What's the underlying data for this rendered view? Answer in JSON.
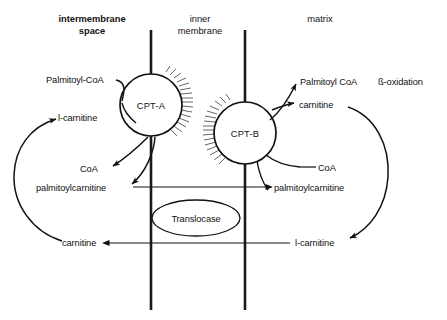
{
  "figure": {
    "background_color": "#ffffff",
    "ink_color": "#121212"
  },
  "headers": {
    "left": "intermembrane\nspace",
    "left_line1": "intermembrane",
    "left_line2": "space",
    "middle_line1": "inner",
    "middle_line2": "membrane",
    "right": "matrix"
  },
  "enzymes": {
    "cpt_a": "CPT-A",
    "cpt_b": "CPT-B",
    "translocase": "Translocase"
  },
  "labels": {
    "palmitoyl_coa_left": "Palmitoyl-CoA",
    "l_carnitine_left": "l-carnitine",
    "coa_left": "CoA",
    "palmitoylcarnitine_left": "palmitoylcarnitine",
    "carnitine_left": "carnitine",
    "palmitoyl_coa_right": "Palmitoyl CoA",
    "beta_oxidation": "ß-oxidation",
    "carnitine_right": "carnitine",
    "coa_right": "CoA",
    "palmitoylcarnitine_right": "palmitoylcarnitine",
    "l_carnitine_right": "l-carnitine"
  },
  "membranes": {
    "left_line_x": 151,
    "right_line_x": 245,
    "top_y": 30,
    "bottom_y": 310
  },
  "geometry": {
    "cpt_a_center": [
      151,
      105
    ],
    "cpt_a_radius": 31,
    "cpt_b_center": [
      245,
      133
    ],
    "cpt_b_radius": 31,
    "translocase_center": [
      196,
      218
    ],
    "translocase_rx": 44,
    "translocase_ry": 18
  }
}
